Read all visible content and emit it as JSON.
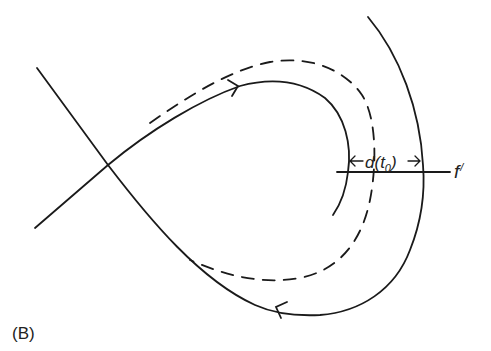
{
  "figure": {
    "panel_label": "(B)",
    "labels": {
      "distance_d": "d(",
      "distance_t": "t",
      "distance_sub": "0",
      "distance_close": ")",
      "section": "f",
      "section_prime": "/"
    },
    "colors": {
      "stroke": "#1a1a1a",
      "background": "#ffffff"
    },
    "elements": [
      "saddle-point-crossing",
      "homoclinic-loop-solid",
      "perturbed-orbit-dashed",
      "outer-trajectory",
      "transversal-section-f-prime",
      "distance-arrow-d-t0"
    ]
  }
}
